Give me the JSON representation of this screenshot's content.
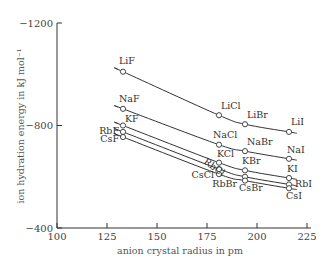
{
  "chart_data": {
    "type": "line",
    "title": "",
    "xlabel": "anion crystal radius in pm",
    "ylabel": "ion hydration energy in kJ mol⁻¹",
    "xlim": [
      100,
      225
    ],
    "ylim": [
      -400,
      -1200
    ],
    "x_ticks": [
      100,
      125,
      150,
      175,
      200,
      225
    ],
    "x_tick_labels": [
      "100",
      "125",
      "150",
      "175",
      "200",
      "225"
    ],
    "y_ticks": [
      -1200,
      -800,
      -400
    ],
    "y_tick_labels": [
      "−1200",
      "−800",
      "−400"
    ],
    "grid": false,
    "legend": "none (points labeled directly)",
    "anions": [
      "F",
      "Cl",
      "Br",
      "I"
    ],
    "x": [
      133,
      181,
      194,
      216
    ],
    "series": [
      {
        "name": "Li",
        "labels": [
          "LiF",
          "LiCl",
          "LiBr",
          "LiI"
        ],
        "values": [
          -1010,
          -840,
          -805,
          -775
        ]
      },
      {
        "name": "Na",
        "labels": [
          "NaF",
          "NaCl",
          "NaBr",
          "NaI"
        ],
        "values": [
          -865,
          -725,
          -700,
          -670
        ]
      },
      {
        "name": "K",
        "labels": [
          "KF",
          "KCl",
          "KBr",
          "KI"
        ],
        "values": [
          -800,
          -655,
          -625,
          -595
        ]
      },
      {
        "name": "Rb",
        "labels": [
          "RbF",
          "RbCl",
          "RbBr",
          "RbI"
        ],
        "values": [
          -775,
          -630,
          -600,
          -570
        ]
      },
      {
        "name": "Cs",
        "labels": [
          "CsF",
          "CsCl",
          "CsBr",
          "CsI"
        ],
        "values": [
          -755,
          -610,
          -585,
          -555
        ]
      }
    ]
  }
}
